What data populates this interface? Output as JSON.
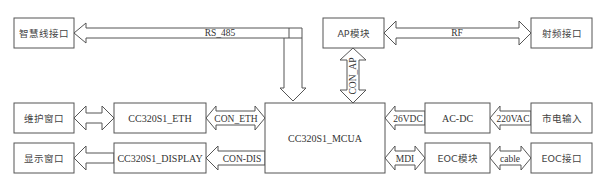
{
  "diagram": {
    "type": "block-diagram",
    "blocks": {
      "smart_line_interface": "智慧线接口",
      "ap_module": "AP模块",
      "rf_interface": "射频接口",
      "maintenance_window": "维护窗口",
      "eth": "CC320S1_ETH",
      "display_window": "显示窗口",
      "display": "CC320S1_DISPLAY",
      "mcua": "CC320S1_MCUA",
      "acdc": "AC-DC",
      "mains_input": "市电输入",
      "eoc_module": "EOC模块",
      "eoc_interface": "EOC接口"
    },
    "links": {
      "rs485": "RS_485",
      "rf": "RF",
      "con_ap": "CON_AP",
      "con_eth": "CON_ETH",
      "con_dis": "CON-DIS",
      "vdc": "26VDC",
      "vac": "220VAC",
      "mdi": "MDI",
      "cable": "cable"
    }
  }
}
